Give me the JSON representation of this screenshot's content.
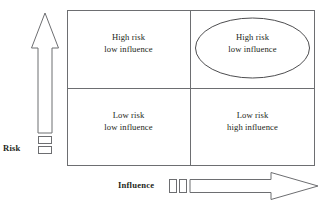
{
  "diagram": {
    "type": "2x2-matrix",
    "title": "",
    "axes": {
      "vertical": {
        "label": "Risk",
        "direction": "up",
        "icon": "up-arrow-icon",
        "handles": 2
      },
      "horizontal": {
        "label": "Influence",
        "direction": "right",
        "icon": "right-arrow-icon",
        "handles": 2
      }
    },
    "quadrants": [
      {
        "id": "top-left",
        "position": "top-left",
        "line1": "High risk",
        "line2": "low influence",
        "highlighted": false
      },
      {
        "id": "top-right",
        "position": "top-right",
        "line1": "High risk",
        "line2": "low influence",
        "highlighted": true,
        "highlight_shape": "ellipse"
      },
      {
        "id": "bottom-left",
        "position": "bottom-left",
        "line1": "Low risk",
        "line2": "low influence",
        "highlighted": false
      },
      {
        "id": "bottom-right",
        "position": "bottom-right",
        "line1": "Low risk",
        "line2": "high influence",
        "highlighted": false
      }
    ],
    "colors": {
      "stroke": "#6d6e71",
      "text": "#231f20",
      "background": "#ffffff"
    }
  }
}
